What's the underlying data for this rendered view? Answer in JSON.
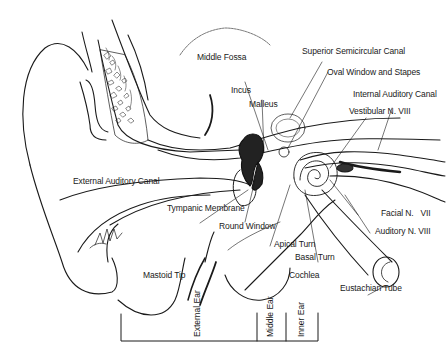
{
  "diagram": {
    "labels": {
      "middle_fossa": "Middle Fossa",
      "superior_semicircular_canal": "Superior Semicircular Canal",
      "oval_window_and_stapes": "Oval Window and Stapes",
      "incus": "Incus",
      "malleus": "Malleus",
      "internal_auditory_canal": "Internal Auditory Canal",
      "vestibular_n_viii": "Vestibular N. VIII",
      "external_auditory_canal": "External Auditory Canal",
      "tympanic_membrane": "Tympanic Membrane",
      "facial_n_vii": "Facial N.   VII",
      "auditory_n_viii": "Auditory N. VIII",
      "round_window": "Round Window",
      "apical_turn": "Apical Turn",
      "basal_turn": "Basal Turn",
      "mastoid_tip": "Mastoid Tip",
      "cochlea": "Cochlea",
      "eustachian_tube": "Eustachian Tube"
    },
    "regions": {
      "external_ear": "External Ear",
      "middle_ear": "Middle Ear",
      "inner_ear": "Inner Ear"
    },
    "colors": {
      "line": "#1a1a1a",
      "background": "#ffffff",
      "fill_dark": "#222222"
    }
  }
}
